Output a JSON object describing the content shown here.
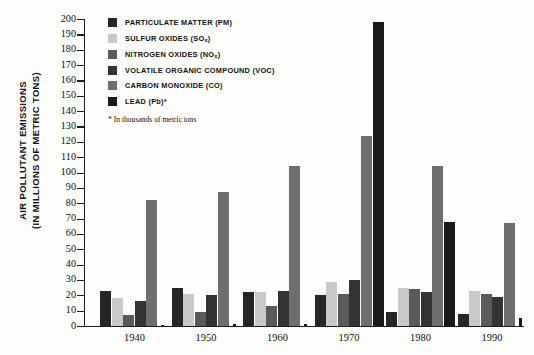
{
  "chart_data": {
    "type": "bar",
    "title": "AIR POLLUTANT EMISSIONS (IN MILLIONS OF METRIC TONS)",
    "ylabel_line1": "AIR POLLUTANT  EMISSIONS",
    "ylabel_line2": "(IN MILLIONS OF METRIC TONS)",
    "xlabel": "",
    "ylim": [
      0,
      200
    ],
    "ytick_step": 10,
    "grid": false,
    "legend_position": "top-left",
    "categories": [
      "1940",
      "1950",
      "1960",
      "1970",
      "1980",
      "1990"
    ],
    "yticks": [
      "200",
      "190",
      "180",
      "170",
      "160",
      "150",
      "140",
      "130",
      "120",
      "110",
      "100",
      "90",
      "80",
      "70",
      "60",
      "50",
      "40",
      "30",
      "20",
      "10",
      "0"
    ],
    "series": [
      {
        "name": "PARTICULATE MATTER (PM)",
        "color": "#262626",
        "values": [
          23,
          25,
          22,
          20,
          9,
          8
        ]
      },
      {
        "name": "SULFUR OXIDES (SO<sub>x</sub>)",
        "color": "#c9c9c9",
        "values": [
          18,
          21,
          22,
          29,
          25,
          23
        ]
      },
      {
        "name": "NITROGEN OXIDES (NO<sub>x</sub>)",
        "color": "#5a5a5a",
        "values": [
          7,
          9,
          13,
          21,
          24,
          21
        ]
      },
      {
        "name": "VOLATILE ORGANIC COMPOUND (VOC)",
        "color": "#333333",
        "values": [
          16,
          20,
          23,
          30,
          22,
          19
        ]
      },
      {
        "name": "CARBON MONOXIDE (CO)",
        "color": "#6e6e6e",
        "values": [
          82,
          87,
          104,
          124,
          104,
          67
        ]
      },
      {
        "name": "LEAD (Pb)*",
        "color": "#1a1a1a",
        "values": [
          0.5,
          1,
          1.5,
          198,
          68,
          5
        ]
      }
    ],
    "footnote": "* In thousands of metric tons"
  },
  "legend": {
    "items": [
      {
        "label": "PARTICULATE MATTER (PM)",
        "swatch": "#262626"
      },
      {
        "label": "SULFUR OXIDES (SOx)",
        "swatch": "#c9c9c9"
      },
      {
        "label": "NITROGEN OXIDES (NOx)",
        "swatch": "#5a5a5a"
      },
      {
        "label": "VOLATILE ORGANIC COMPOUND (VOC)",
        "swatch": "#333333"
      },
      {
        "label": "CARBON MONOXIDE (CO)",
        "swatch": "#6e6e6e"
      },
      {
        "label": "LEAD (Pb)*",
        "swatch": "#1a1a1a"
      }
    ],
    "note": "* In thousands of metric tons"
  }
}
